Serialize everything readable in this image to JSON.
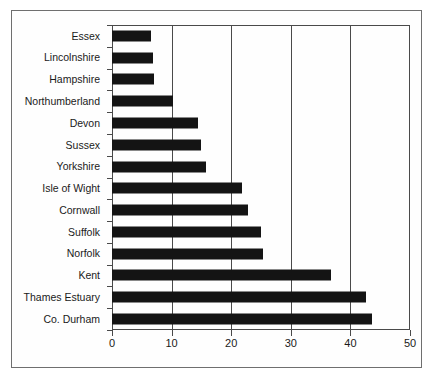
{
  "figure": {
    "border_color": "#6f6f6f",
    "axis_color": "#4a4a4a",
    "bar_color": "#141414",
    "background": "#ffffff"
  },
  "footer": {
    "scan_text": ""
  },
  "chart_data": {
    "type": "bar",
    "orientation": "horizontal",
    "title": "",
    "subtitle": "",
    "xlabel": "",
    "ylabel": "",
    "xlim": [
      0,
      50
    ],
    "xticks": [
      0,
      10,
      20,
      30,
      40,
      50
    ],
    "xtick_labels": [
      "0",
      "10",
      "20",
      "30",
      "40",
      "50"
    ],
    "grid": "vertical gridlines at 10, 20, 30, 40",
    "gridlines": [
      10,
      20,
      30,
      40
    ],
    "legend": "none",
    "categories": [
      "Essex",
      "Lincolnshire",
      "Hampshire",
      "Northumberland",
      "Devon",
      "Sussex",
      "Yorkshire",
      "Isle of Wight",
      "Cornwall",
      "Suffolk",
      "Norfolk",
      "Kent",
      "Thames Estuary",
      "Co. Durham"
    ],
    "values": [
      6.5,
      6.8,
      7.0,
      10.3,
      14.5,
      15.0,
      15.8,
      21.8,
      22.8,
      25.0,
      25.4,
      36.7,
      42.6,
      43.6
    ],
    "series": [
      {
        "name": "",
        "values": [
          6.5,
          6.8,
          7.0,
          10.3,
          14.5,
          15.0,
          15.8,
          21.8,
          22.8,
          25.0,
          25.4,
          36.7,
          42.6,
          43.6
        ]
      }
    ]
  }
}
